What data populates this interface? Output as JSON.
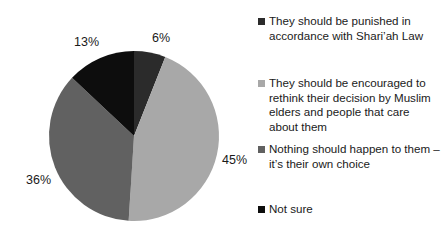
{
  "chart_data": {
    "type": "pie",
    "title": "",
    "subtitle": "",
    "categories": [
      "They should be punished in accordance with Shari’ah Law",
      "They should be encouraged to rethink their decision by Muslim elders and people that care about them",
      "Nothing should happen to them – it’s their own choice",
      "Not sure"
    ],
    "values": [
      6,
      45,
      36,
      13
    ],
    "value_labels": [
      "6%",
      "45%",
      "36%",
      "13%"
    ],
    "colors": [
      "#2b2b2b",
      "#a8a8a8",
      "#616161",
      "#0d0d0d"
    ],
    "units": "percent",
    "start_angle_deg": 0,
    "direction": "clockwise",
    "legend_position": "right",
    "grid": false,
    "xlabel": "",
    "ylabel": ""
  },
  "slice_labels": [
    {
      "text": "6%",
      "left": 152,
      "top": 31
    },
    {
      "text": "45%",
      "left": 222,
      "top": 153
    },
    {
      "text": "36%",
      "left": 26,
      "top": 173
    },
    {
      "text": "13%",
      "left": 74,
      "top": 35
    }
  ],
  "legend": {
    "entries": [
      {
        "label": "They should be punished in accordance with Shari’ah Law",
        "color": "#2b2b2b",
        "swatch_name": "legend-swatch-punished",
        "top": 14
      },
      {
        "label": "They should be encouraged to rethink their decision by Muslim elders and people that care about them",
        "color": "#a8a8a8",
        "swatch_name": "legend-swatch-encouraged",
        "top": 76
      },
      {
        "label": "Nothing should happen to them – it’s their own choice",
        "color": "#616161",
        "swatch_name": "legend-swatch-nothing",
        "top": 142
      },
      {
        "label": "Not sure",
        "color": "#0d0d0d",
        "swatch_name": "legend-swatch-not-sure",
        "top": 202
      }
    ]
  },
  "geometry": {
    "cx": 134,
    "cy": 136,
    "r": 85
  }
}
